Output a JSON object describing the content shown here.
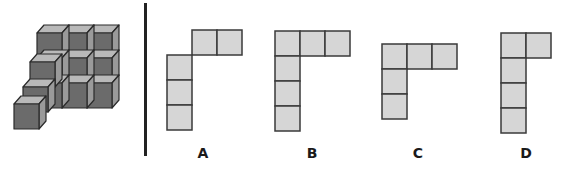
{
  "figure": {
    "colors": {
      "front_face": "#6b6b6b",
      "top_face": "#b9b9b9",
      "side_face": "#9a9a9a",
      "edge": "#2a2a2a",
      "option_fill": "#d6d6d6",
      "option_edge": "#3a3a3a",
      "divider": "#222222"
    }
  },
  "options": [
    {
      "label": "A",
      "cells": [
        [
          1,
          0
        ],
        [
          2,
          0
        ],
        [
          0,
          1
        ],
        [
          0,
          2
        ],
        [
          0,
          3
        ]
      ],
      "origin": [
        167,
        30
      ]
    },
    {
      "label": "B",
      "cells": [
        [
          0,
          0
        ],
        [
          1,
          0
        ],
        [
          2,
          0
        ],
        [
          0,
          1
        ],
        [
          0,
          2
        ],
        [
          0,
          3
        ]
      ],
      "origin": [
        275,
        31
      ]
    },
    {
      "label": "C",
      "cells": [
        [
          0,
          0
        ],
        [
          1,
          0
        ],
        [
          2,
          0
        ],
        [
          0,
          1
        ],
        [
          0,
          2
        ]
      ],
      "origin": [
        382,
        44
      ]
    },
    {
      "label": "D",
      "cells": [
        [
          0,
          0
        ],
        [
          1,
          0
        ],
        [
          0,
          1
        ],
        [
          0,
          2
        ],
        [
          0,
          3
        ]
      ],
      "origin": [
        501,
        33
      ]
    }
  ]
}
